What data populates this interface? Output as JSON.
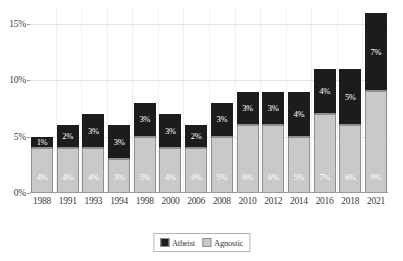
{
  "chart_data": {
    "type": "bar",
    "subtype": "stacked-bar",
    "title": "",
    "xlabel": "",
    "ylabel": "",
    "grid": true,
    "legend_position": "bottom",
    "ylim": [
      0,
      16.4
    ],
    "yticks": [
      0,
      5,
      10,
      15
    ],
    "ytick_labels": [
      "0%",
      "5%",
      "10%",
      "15%"
    ],
    "categories": [
      "1988",
      "1991",
      "1993",
      "1994",
      "1998",
      "2000",
      "2006",
      "2008",
      "2010",
      "2012",
      "2014",
      "2016",
      "2018",
      "2021"
    ],
    "series": [
      {
        "name": "Agnostic",
        "color": "#c9c9c9",
        "values": [
          4,
          4,
          4,
          3,
          5,
          4,
          4,
          5,
          6,
          6,
          5,
          7,
          6,
          9
        ],
        "labels": [
          "4%",
          "4%",
          "4%",
          "3%",
          "5%",
          "4%",
          "4%",
          "5%",
          "6%",
          "6%",
          "5%",
          "7%",
          "6%",
          "9%"
        ]
      },
      {
        "name": "Atheist",
        "color": "#1c1c1c",
        "values": [
          1,
          2,
          3,
          3,
          3,
          3,
          2,
          3,
          3,
          3,
          4,
          4,
          5,
          7
        ],
        "labels": [
          "1%",
          "2%",
          "3%",
          "3%",
          "3%",
          "3%",
          "2%",
          "3%",
          "3%",
          "3%",
          "4%",
          "4%",
          "5%",
          "7%"
        ]
      }
    ],
    "stack_order_bottom_to_top": [
      "Agnostic",
      "Atheist"
    ],
    "legend": [
      {
        "label": "Atheist",
        "color": "#1c1c1c"
      },
      {
        "label": "Agnostic",
        "color": "#c9c9c9"
      }
    ],
    "bar_totals": [
      5,
      6,
      7,
      6,
      8,
      7,
      6,
      8,
      9,
      9,
      9,
      11,
      11,
      16
    ]
  }
}
